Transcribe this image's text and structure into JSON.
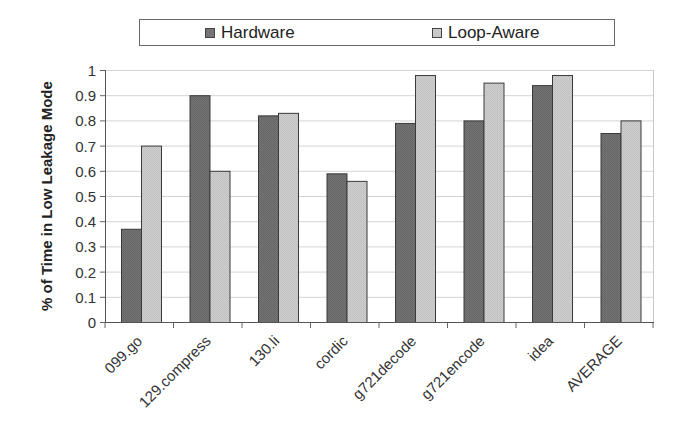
{
  "chart_data": {
    "type": "bar",
    "title": "",
    "xlabel": "",
    "ylabel": "% of Time in Low Leakage Mode",
    "ylim": [
      0,
      1
    ],
    "yticks": [
      "0",
      "0.1",
      "0.2",
      "0.3",
      "0.4",
      "0.5",
      "0.6",
      "0.7",
      "0.8",
      "0.9",
      "1"
    ],
    "grid": true,
    "legend_position": "top",
    "categories": [
      "099.go",
      "129.compress",
      "130.li",
      "cordic",
      "g721decode",
      "g721encode",
      "idea",
      "AVERAGE"
    ],
    "series": [
      {
        "name": "Hardware",
        "color": "#747474",
        "values": [
          0.37,
          0.9,
          0.82,
          0.59,
          0.79,
          0.8,
          0.94,
          0.75
        ]
      },
      {
        "name": "Loop-Aware",
        "color": "#c9c9c9",
        "values": [
          0.7,
          0.6,
          0.83,
          0.56,
          0.98,
          0.95,
          0.98,
          0.8
        ]
      }
    ]
  },
  "legend": {
    "hardware_label": "Hardware",
    "loop_aware_label": "Loop-Aware"
  },
  "axis": {
    "ylabel": "% of Time in Low Leakage Mode"
  }
}
